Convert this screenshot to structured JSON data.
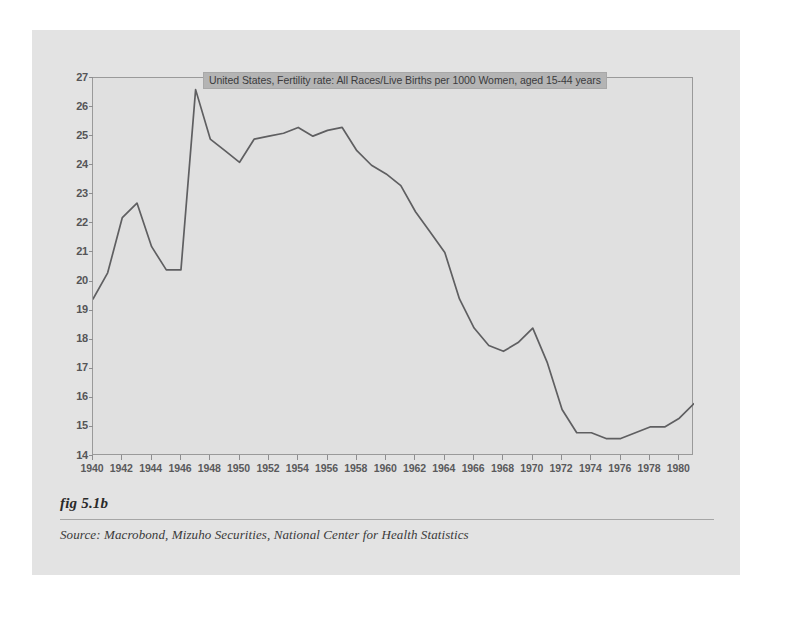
{
  "figure": {
    "label": "fig 5.1b",
    "source": "Source:  Macrobond, Mizuho Securities, National Center for Health Statistics"
  },
  "colors": {
    "panel_background": "#e3e3e3",
    "plot_background": "#e0e0e0",
    "line": "#5f5f61",
    "legend_background": "#b4b4b4",
    "axis": "#9a9a9a"
  },
  "chart_data": {
    "type": "line",
    "title": "",
    "legend": [
      "United States, Fertility rate: All Races/Live Births per 1000 Women, aged 15-44 years"
    ],
    "legend_position": "top-center-inside",
    "grid": false,
    "xlabel": "",
    "ylabel": "",
    "xlim": [
      1940,
      1981
    ],
    "ylim": [
      14,
      27
    ],
    "yticks": [
      27,
      26,
      25,
      24,
      23,
      22,
      21,
      20,
      19,
      18,
      17,
      16,
      15,
      14
    ],
    "xticks": [
      1940,
      1942,
      1944,
      1946,
      1948,
      1950,
      1952,
      1954,
      1956,
      1958,
      1960,
      1962,
      1964,
      1966,
      1968,
      1970,
      1972,
      1974,
      1976,
      1978,
      1980
    ],
    "series": [
      {
        "name": "United States, Fertility rate: All Races/Live Births per 1000 Women, aged 15-44 years",
        "x": [
          1940,
          1941,
          1942,
          1943,
          1944,
          1945,
          1946,
          1947,
          1948,
          1949,
          1950,
          1951,
          1952,
          1953,
          1954,
          1955,
          1956,
          1957,
          1958,
          1959,
          1960,
          1961,
          1962,
          1963,
          1964,
          1965,
          1966,
          1967,
          1968,
          1969,
          1970,
          1971,
          1972,
          1973,
          1974,
          1975,
          1976,
          1977,
          1978,
          1979,
          1980,
          1981
        ],
        "values": [
          19.4,
          20.3,
          22.2,
          22.7,
          21.2,
          20.4,
          20.4,
          26.6,
          24.9,
          24.5,
          24.1,
          24.9,
          25.0,
          25.1,
          25.3,
          25.0,
          25.2,
          25.3,
          24.5,
          24.0,
          23.7,
          23.3,
          22.4,
          21.7,
          21.0,
          19.4,
          18.4,
          17.8,
          17.6,
          17.9,
          18.4,
          17.2,
          15.6,
          14.8,
          14.8,
          14.6,
          14.6,
          14.8,
          15.0,
          15.0,
          15.3,
          15.8
        ],
        "line_style": "solid",
        "marker": "none"
      }
    ]
  }
}
